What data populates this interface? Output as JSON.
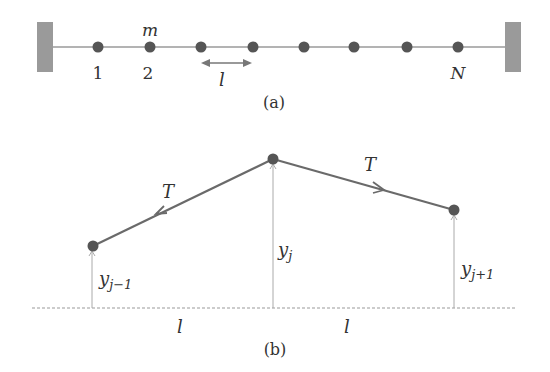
{
  "figure_a": {
    "mass_label": "m",
    "index_labels": [
      "1",
      "2",
      "N"
    ],
    "spacing_label": "l",
    "caption": "(a)"
  },
  "figure_b": {
    "tension_left": "T",
    "tension_right": "T",
    "y_left": "y",
    "y_left_sub": "j−1",
    "y_mid": "y",
    "y_mid_sub": "j",
    "y_right": "y",
    "y_right_sub": "j+1",
    "spacing_left": "l",
    "spacing_right": "l",
    "caption": "(b)"
  },
  "colors": {
    "string": "#8a8a8a",
    "mass": "#555555",
    "wall": "#9a9a9a",
    "tension_line": "#6a6a6a",
    "text": "#333333"
  }
}
